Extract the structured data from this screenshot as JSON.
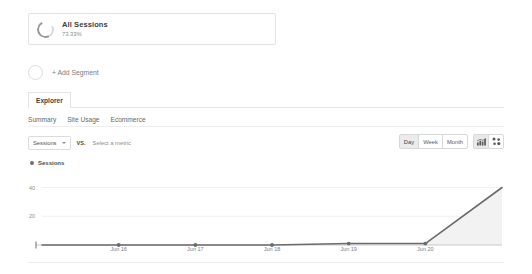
{
  "segment": {
    "icon": "donut-progress-icon",
    "title": "All Sessions",
    "percent": "73.33%"
  },
  "add_segment": {
    "label": "+ Add Segment",
    "icon": "empty-circle-icon"
  },
  "tabs": {
    "primary": "Explorer",
    "sub": [
      "Summary",
      "Site Usage",
      "Ecommerce"
    ]
  },
  "metric_row": {
    "selected_metric": "Sessions",
    "vs_label": "VS.",
    "compare_placeholder": "Select a metric",
    "caret": "chevron-down-icon"
  },
  "controls": {
    "granularity": [
      "Day",
      "Week",
      "Month"
    ],
    "granularity_active": "Day",
    "icons": [
      "bar-chart-icon",
      "scatter-plot-icon"
    ],
    "icon_active": "bar-chart-icon"
  },
  "legend": {
    "series_label": "Sessions",
    "dot_color": "#6f6f6f"
  },
  "chart_data": {
    "type": "line",
    "title": "Sessions",
    "xlabel": "",
    "ylabel": "Sessions",
    "grid": true,
    "legend_position": "top-left",
    "line_color": "#6b6b6b",
    "fill_color": "#f1f1f1",
    "ylim": [
      0,
      48
    ],
    "yticks": [
      20,
      40
    ],
    "ytick_labels": [
      "20",
      "40"
    ],
    "x": [
      "Jun 15",
      "Jun 16",
      "Jun 17",
      "Jun 18",
      "Jun 19",
      "Jun 20",
      "Jun 21"
    ],
    "xtick_labels": [
      "Jun 16",
      "Jun 17",
      "Jun 18",
      "Jun 19",
      "Jun 20"
    ],
    "series": [
      {
        "name": "Sessions",
        "values": [
          0,
          0,
          0,
          0,
          1,
          1,
          40
        ]
      }
    ]
  }
}
